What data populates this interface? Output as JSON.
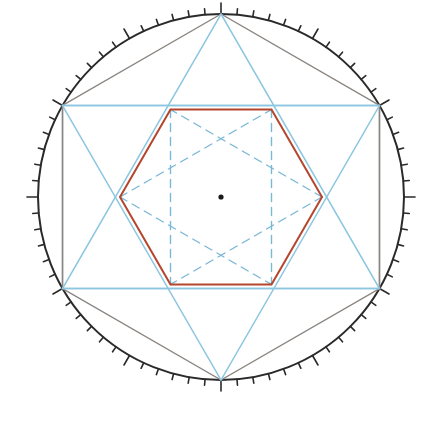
{
  "diagram": {
    "tick_step_degrees": 5,
    "major_tick_every_degrees": 30,
    "colors": {
      "circle": "#2a2a2a",
      "ticks": "#2a2a2a",
      "outer_hexagon": "#8a8580",
      "construction_lines": "#8cc6e0",
      "dashed_lines": "#7ab8d6",
      "inner_hexagon": "#b5452c",
      "center_point": "#1a1a1a"
    },
    "elements": [
      {
        "name": "outer-circle",
        "label": "Circle"
      },
      {
        "name": "outer-hexagon",
        "label": "Regular hexagon inscribed in circle"
      },
      {
        "name": "hexagram",
        "label": "Star of David (two equilateral triangles)"
      },
      {
        "name": "vertical-sides",
        "label": "Vertical chords"
      },
      {
        "name": "inner-hexagon",
        "label": "Inner regular hexagon"
      },
      {
        "name": "dashed-construction",
        "label": "Dashed inner hexagram and rectangle"
      },
      {
        "name": "center-point",
        "label": "Center"
      }
    ]
  }
}
